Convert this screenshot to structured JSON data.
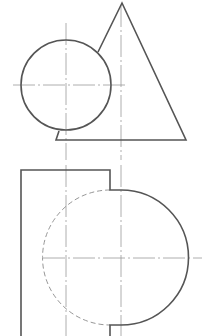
{
  "colors": {
    "background": "#ffffff",
    "outline": "#555555",
    "centerline": "#9a9a9a",
    "hidden": "#8a8a8a"
  },
  "top_view": {
    "sphere": {
      "cx": 66,
      "cy": 85,
      "r": 45
    },
    "cone": {
      "apex": [
        122,
        3
      ],
      "left_tangent_point": [
        98,
        52
      ],
      "base_left": [
        56,
        140
      ],
      "base_right": [
        186,
        140
      ],
      "stub_top": [
        59,
        131
      ]
    },
    "centerlines": {
      "sphere_horizontal": {
        "x1": 13,
        "y1": 85,
        "x2": 125,
        "y2": 85
      },
      "sphere_vertical": {
        "x1": 66,
        "y1": 23,
        "x2": 66,
        "y2": 160
      },
      "cone_axis": {
        "x1": 121,
        "y1": 5,
        "x2": 121,
        "y2": 160
      }
    }
  },
  "front_view": {
    "block": {
      "left": 21,
      "top": 170,
      "right": 110,
      "bottom": 336,
      "step_top": 190,
      "step_bottom": 325
    },
    "semicircle": {
      "cx": 121,
      "cy": 258,
      "r": 67
    },
    "hidden_arc": {
      "cx": 121,
      "cy": 258,
      "r": 66
    },
    "centerlines": {
      "horizontal": {
        "x1": 43,
        "y1": 258,
        "x2": 202,
        "y2": 258
      },
      "block_vertical": {
        "x1": 66,
        "y1": 165,
        "x2": 66,
        "y2": 336
      },
      "axis_vertical": {
        "x1": 121,
        "y1": 165,
        "x2": 121,
        "y2": 336
      }
    }
  }
}
